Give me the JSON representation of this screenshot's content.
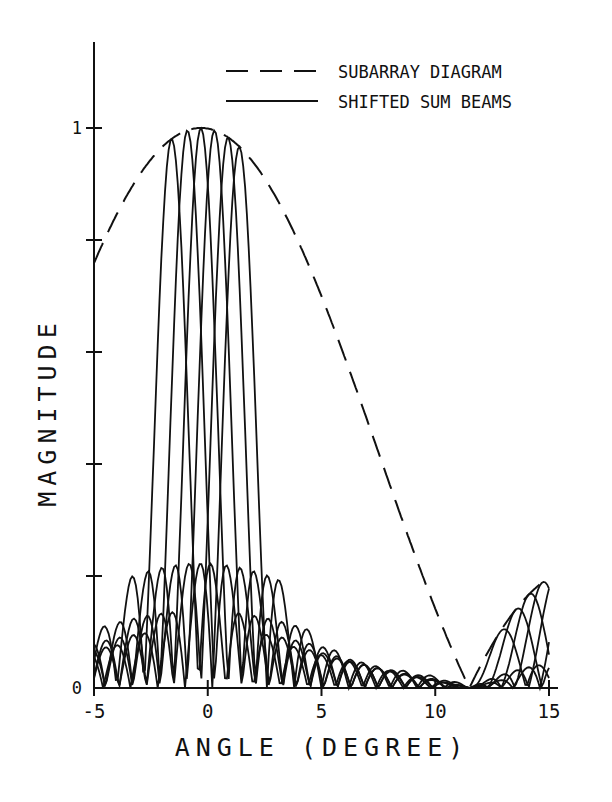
{
  "chart_data": {
    "type": "line",
    "title": "",
    "xlabel": "ANGLE (DEGREE)",
    "ylabel": "MAGNITUDE",
    "xlim": [
      -5,
      15
    ],
    "ylim": [
      0,
      1.1
    ],
    "x_ticks": [
      -5,
      0,
      5,
      10,
      15
    ],
    "x_tick_labels": [
      "-5",
      "0",
      "5",
      "10",
      "15"
    ],
    "y_ticks": [
      0,
      0.2,
      0.4,
      0.6,
      0.8,
      1.0
    ],
    "y_tick_labels": [
      "0",
      "",
      "",
      "",
      "",
      "1"
    ],
    "grid": false,
    "legend": {
      "position": "upper right",
      "entries": [
        {
          "label": "SUBARRAY DIAGRAM",
          "style": "dashed"
        },
        {
          "label": "SHIFTED SUM BEAMS",
          "style": "solid"
        }
      ]
    },
    "series": [
      {
        "name": "SUBARRAY DIAGRAM",
        "style": "dashed",
        "x": [
          -5,
          -4,
          -3,
          -2,
          -1,
          -0.3,
          0,
          1,
          2,
          3,
          4,
          5,
          6,
          7,
          8,
          9,
          10,
          11,
          11.5,
          12,
          13,
          14,
          15
        ],
        "y": [
          0.71,
          0.8,
          0.88,
          0.95,
          0.99,
          1.0,
          1.0,
          0.98,
          0.93,
          0.86,
          0.77,
          0.67,
          0.56,
          0.45,
          0.34,
          0.23,
          0.13,
          0.04,
          0.0,
          0.05,
          0.11,
          0.16,
          0.2
        ]
      },
      {
        "name": "SHIFTED SUM BEAMS",
        "style": "solid",
        "beam_peak_angles": [
          -1.6,
          -0.9,
          -0.3,
          0.3,
          0.9,
          1.4
        ],
        "beam_peak_values": [
          0.97,
          0.99,
          1.0,
          1.0,
          0.99,
          0.97
        ],
        "first_null_halfwidth_deg": 1.2,
        "sidelobe_max_near_mainlobe": 0.2,
        "grating_lobe_peaks": [
          {
            "x": 9.8,
            "y": 0.15
          },
          {
            "x": 13.6,
            "y": 0.11
          }
        ]
      }
    ]
  }
}
